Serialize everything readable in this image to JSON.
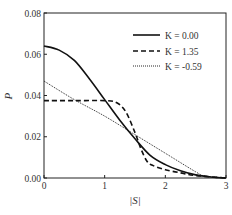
{
  "chart_data": {
    "type": "line",
    "title": "",
    "xlabel": "|S|",
    "ylabel": "P",
    "xlim": [
      0,
      3
    ],
    "ylim": [
      0,
      0.08
    ],
    "x_ticks": [
      "0",
      "1",
      "2",
      "3"
    ],
    "y_ticks": [
      "0.00",
      "0.02",
      "0.04",
      "0.06",
      "0.08"
    ],
    "grid": false,
    "legend_position": "upper right",
    "series": [
      {
        "name": "K = 0.00",
        "style": "solid",
        "x": [
          0,
          0.25,
          0.5,
          0.75,
          1.0,
          1.25,
          1.5,
          1.75,
          2.0,
          2.25,
          2.5,
          2.75,
          3.0
        ],
        "y": [
          0.064,
          0.062,
          0.057,
          0.048,
          0.038,
          0.028,
          0.019,
          0.011,
          0.0065,
          0.0035,
          0.0015,
          0.0005,
          0.0
        ]
      },
      {
        "name": "K = 1.35",
        "style": "dashed",
        "x": [
          0,
          0.5,
          1.0,
          1.2,
          1.35,
          1.5,
          1.6,
          1.7,
          1.8,
          2.0,
          2.25,
          2.5,
          3.0
        ],
        "y": [
          0.0375,
          0.0375,
          0.0375,
          0.0365,
          0.032,
          0.022,
          0.014,
          0.008,
          0.006,
          0.004,
          0.0025,
          0.0012,
          0.0
        ]
      },
      {
        "name": "K = -0.59",
        "style": "dotted",
        "x": [
          0,
          0.5,
          1.0,
          1.5,
          2.0,
          2.5,
          2.65,
          3.0
        ],
        "y": [
          0.047,
          0.038,
          0.03,
          0.021,
          0.012,
          0.003,
          0.001,
          0.0
        ]
      }
    ]
  },
  "legend": {
    "items": [
      "K = 0.00",
      "K = 1.35",
      "K = -0.59"
    ]
  }
}
